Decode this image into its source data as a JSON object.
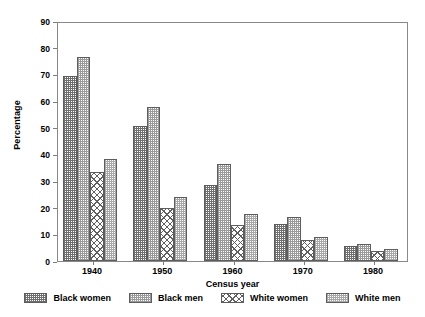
{
  "chart_data": {
    "type": "bar",
    "title": "",
    "xlabel": "Census year",
    "ylabel": "Percentage",
    "categories": [
      "1940",
      "1950",
      "1960",
      "1970",
      "1980"
    ],
    "ylim": [
      0,
      90
    ],
    "yticks": [
      0,
      10,
      20,
      30,
      40,
      50,
      60,
      70,
      80,
      90
    ],
    "grid": false,
    "legend_position": "bottom",
    "series": [
      {
        "name": "Black women",
        "pattern": "dense-dark-checker",
        "values": [
          69.5,
          50.7,
          28.5,
          14.0,
          5.5
        ]
      },
      {
        "name": "Black men",
        "pattern": "light-checker",
        "values": [
          76.5,
          57.7,
          36.3,
          16.5,
          6.5
        ]
      },
      {
        "name": "White women",
        "pattern": "open-cross-hatch",
        "values": [
          33.5,
          19.8,
          13.5,
          7.8,
          3.8
        ]
      },
      {
        "name": "White men",
        "pattern": "pale-checker",
        "values": [
          38.2,
          24.0,
          17.7,
          9.0,
          4.5
        ]
      }
    ]
  },
  "axes": {
    "y_title": "Percentage",
    "x_title": "Census year"
  },
  "colors": {
    "frame": "#888888",
    "bar_outline": "#5d5d5d",
    "background": "#ffffff",
    "text": "#000000"
  }
}
